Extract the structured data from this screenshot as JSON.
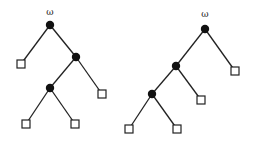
{
  "diagram": {
    "type": "binary-trees",
    "trees": [
      {
        "name": "left-tree",
        "root_label": "ω",
        "label_pos": [
          50,
          15
        ],
        "inner_nodes": [
          {
            "id": "root",
            "x": 50,
            "y": 25
          },
          {
            "id": "mid",
            "x": 76,
            "y": 57
          },
          {
            "id": "low",
            "x": 50,
            "y": 88
          }
        ],
        "leaves": [
          {
            "id": "leaf-1",
            "x": 21,
            "y": 64
          },
          {
            "id": "leaf-2",
            "x": 102,
            "y": 94
          },
          {
            "id": "leaf-3",
            "x": 26,
            "y": 124
          },
          {
            "id": "leaf-4",
            "x": 75,
            "y": 124
          }
        ],
        "edges": [
          [
            "root",
            "leaf-1"
          ],
          [
            "root",
            "mid"
          ],
          [
            "mid",
            "low"
          ],
          [
            "mid",
            "leaf-2"
          ],
          [
            "low",
            "leaf-3"
          ],
          [
            "low",
            "leaf-4"
          ]
        ]
      },
      {
        "name": "right-tree",
        "root_label": "ω",
        "label_pos": [
          205,
          17
        ],
        "inner_nodes": [
          {
            "id": "root",
            "x": 205,
            "y": 29
          },
          {
            "id": "mid",
            "x": 176,
            "y": 66
          },
          {
            "id": "low",
            "x": 152,
            "y": 94
          }
        ],
        "leaves": [
          {
            "id": "leaf-1",
            "x": 235,
            "y": 71
          },
          {
            "id": "leaf-2",
            "x": 201,
            "y": 100
          },
          {
            "id": "leaf-3",
            "x": 129,
            "y": 129
          },
          {
            "id": "leaf-4",
            "x": 177,
            "y": 129
          }
        ],
        "edges": [
          [
            "root",
            "mid"
          ],
          [
            "root",
            "leaf-1"
          ],
          [
            "mid",
            "low"
          ],
          [
            "mid",
            "leaf-2"
          ],
          [
            "low",
            "leaf-3"
          ],
          [
            "low",
            "leaf-4"
          ]
        ]
      }
    ]
  }
}
